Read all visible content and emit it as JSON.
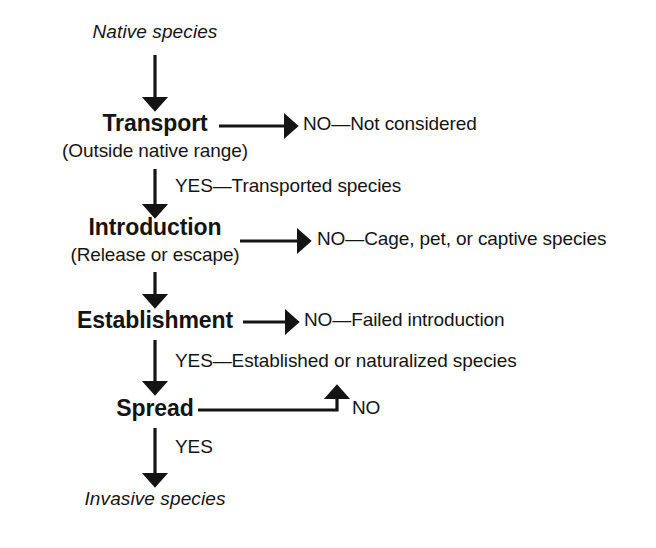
{
  "diagram": {
    "ink_color": "#141414",
    "start": {
      "label": "Native species"
    },
    "end": {
      "label": "Invasive species"
    },
    "stages": [
      {
        "id": "transport",
        "label": "Transport",
        "sublabel": "(Outside native range)",
        "no_branch": "NO—Not considered",
        "yes_edge": "YES—Transported species"
      },
      {
        "id": "introduction",
        "label": "Introduction",
        "sublabel": "(Release or escape)",
        "no_branch": "NO—Cage, pet, or captive species",
        "yes_edge": ""
      },
      {
        "id": "establishment",
        "label": "Establishment",
        "sublabel": "",
        "no_branch": "NO—Failed introduction",
        "yes_edge": "YES—Established or naturalized species"
      },
      {
        "id": "spread",
        "label": "Spread",
        "sublabel": "",
        "no_branch": "NO",
        "yes_edge": "YES"
      }
    ]
  }
}
